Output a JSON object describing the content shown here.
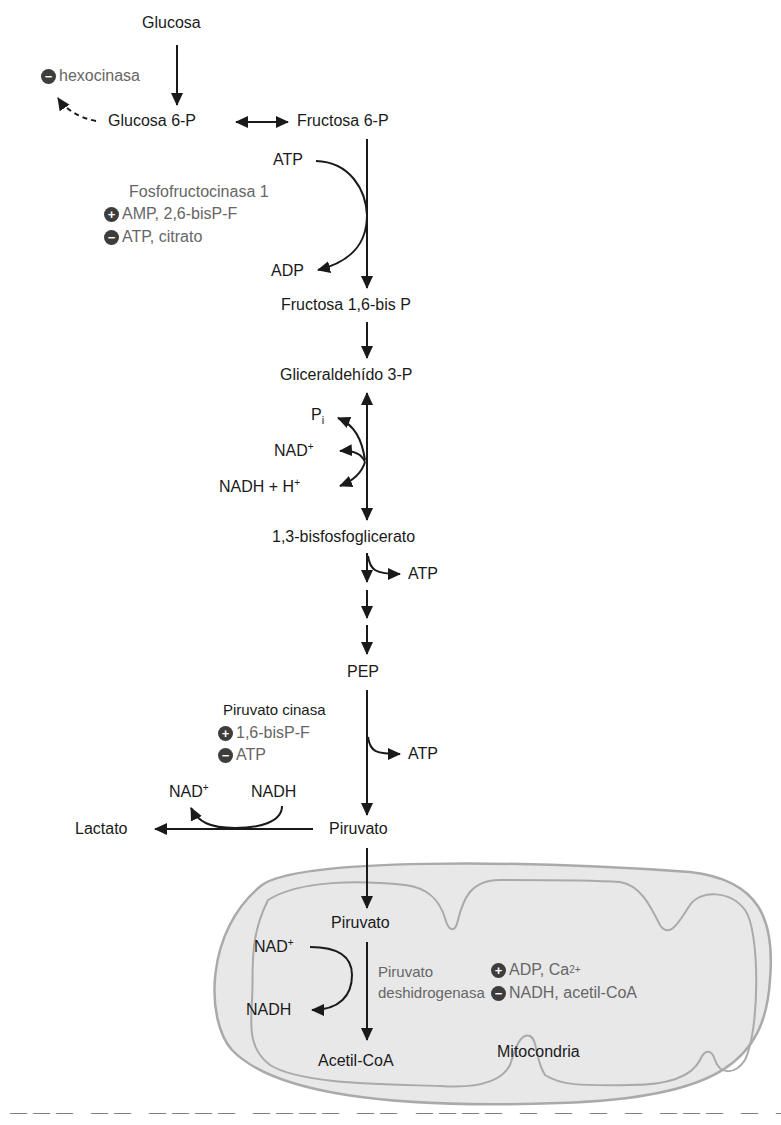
{
  "colors": {
    "ink": "#1a1a1a",
    "regulator_text": "#666666",
    "badge_fill": "#3d3d3d",
    "mito_fill": "#e8e8e8",
    "mito_membrane": "#aaaaaa"
  },
  "metabolites": {
    "glucose": "Glucosa",
    "glucose6p": "Glucosa 6-P",
    "fructose6p": "Fructosa 6-P",
    "fructose16bp": "Fructosa 1,6-bis P",
    "g3p": "Gliceraldehído 3-P",
    "bpg13": "1,3-bisfosfoglicerato",
    "pep": "PEP",
    "pyruvate": "Piruvato",
    "lactate": "Lactato",
    "pyruvate_mito": "Piruvato",
    "acetylcoa": "Acetil-CoA"
  },
  "cofactors": {
    "pfk_atp_in": "ATP",
    "pfk_adp_out": "ADP",
    "gapdh_pi": "P",
    "gapdh_pi_sub": "i",
    "gapdh_nad": "NAD",
    "gapdh_nad_sup": "+",
    "gapdh_nadh": "NADH + H",
    "gapdh_nadh_sup": "+",
    "pgk_atp": "ATP",
    "pk_atp": "ATP",
    "ldh_nad": "NAD",
    "ldh_nad_sup": "+",
    "ldh_nadh": "NADH",
    "pdh_nad": "NAD",
    "pdh_nad_sup": "+",
    "pdh_nadh": "NADH"
  },
  "enzymes": {
    "hexokinase": {
      "sign": "−",
      "label": "hexocinasa"
    },
    "pfk1": {
      "name": "Fosfofructocinasa 1",
      "activators": {
        "sign": "+",
        "label": "AMP, 2,6-bisP-F"
      },
      "inhibitors": {
        "sign": "−",
        "label": "ATP, citrato"
      }
    },
    "pyruvate_kinase": {
      "name": "Piruvato cinasa",
      "activators": {
        "sign": "+",
        "label": "1,6-bisP-F"
      },
      "inhibitors": {
        "sign": "−",
        "label": "ATP"
      }
    },
    "pdh": {
      "name_line1": "Piruvato",
      "name_line2": "deshidrogenasa",
      "activators": {
        "sign": "+",
        "label": "ADP, Ca",
        "sup": "2+"
      },
      "inhibitors": {
        "sign": "−",
        "label": "NADH, acetil-CoA"
      }
    }
  },
  "organelle": {
    "label": "Mitocondria"
  },
  "caption_partial": "clipped caption text (only top of glyphs visible)"
}
